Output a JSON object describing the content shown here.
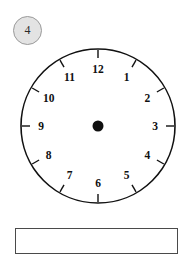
{
  "exercise": {
    "number_label": "4"
  },
  "clock": {
    "name": "analog-clock-face",
    "hub_label": "",
    "numerals": [
      {
        "label": "12",
        "hour": 12
      },
      {
        "label": "1",
        "hour": 1
      },
      {
        "label": "2",
        "hour": 2
      },
      {
        "label": "3",
        "hour": 3
      },
      {
        "label": "4",
        "hour": 4
      },
      {
        "label": "5",
        "hour": 5
      },
      {
        "label": "6",
        "hour": 6
      },
      {
        "label": "7",
        "hour": 7
      },
      {
        "label": "8",
        "hour": 8
      },
      {
        "label": "9",
        "hour": 9
      },
      {
        "label": "10",
        "hour": 10
      },
      {
        "label": "11",
        "hour": 11
      }
    ],
    "hands": [],
    "colors": {
      "rim": "#111111",
      "face": "#ffffff",
      "hub": "#101010",
      "numeral": "#101010"
    }
  },
  "answer_box": {
    "value": "",
    "placeholder": ""
  },
  "badge_colors": {
    "fill": "#e3e3e3",
    "border": "#9a9a9a",
    "text": "#2b2b2b"
  }
}
